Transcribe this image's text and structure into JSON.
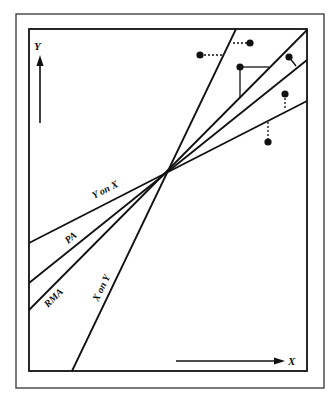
{
  "diagram": {
    "axes": {
      "y_label": "Y",
      "x_label": "X"
    },
    "lines": [
      {
        "id": "x-on-y",
        "label": "X on Y",
        "x1": 72,
        "y1": 371,
        "x2": 236,
        "y2": 29
      },
      {
        "id": "rma",
        "label": "RMA",
        "x1": 29,
        "y1": 310,
        "x2": 307,
        "y2": 30
      },
      {
        "id": "pa",
        "label": "PA",
        "x1": 29,
        "y1": 283,
        "x2": 307,
        "y2": 60
      },
      {
        "id": "y-on-x",
        "label": "Y on X",
        "x1": 29,
        "y1": 243,
        "x2": 307,
        "y2": 101
      }
    ],
    "intersection": {
      "x": 167,
      "y": 172
    },
    "points": [
      {
        "x": 200,
        "y": 55,
        "residual": "dotted-horizontal",
        "to": [
          222,
          55
        ]
      },
      {
        "x": 250,
        "y": 43,
        "residual": "dotted-horizontal",
        "to": [
          233,
          43
        ]
      },
      {
        "x": 240,
        "y": 67,
        "residual": "solid-triangle",
        "to_h": [
          269,
          67
        ],
        "to_v": [
          240,
          97
        ]
      },
      {
        "x": 289,
        "y": 57,
        "residual": "solid-perpendicular",
        "to": [
          296,
          66
        ]
      },
      {
        "x": 285,
        "y": 94,
        "residual": "dotted-vertical",
        "to": [
          285,
          108
        ]
      },
      {
        "x": 268,
        "y": 142,
        "residual": "dotted-vertical",
        "to": [
          268,
          122
        ]
      }
    ],
    "colors": {
      "ink": "#111111",
      "background": "#ffffff"
    }
  }
}
